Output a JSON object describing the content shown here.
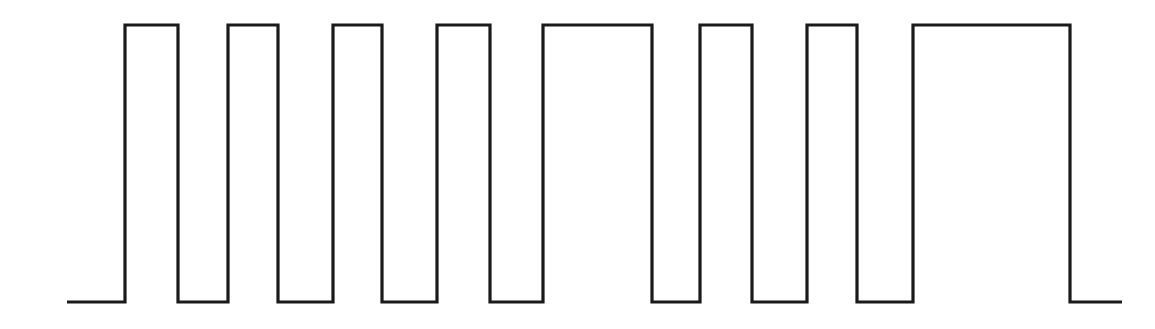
{
  "page": {
    "background_color": "#ffffff",
    "width": 1155,
    "height": 329
  },
  "chart_data": {
    "type": "line",
    "subtitle": "",
    "xlabel": "",
    "ylabel": "",
    "grid": false,
    "legend": "none",
    "annotations": [],
    "tick_labels": {
      "x": [],
      "y": []
    },
    "axis_ranges": {
      "xlim": [
        0,
        1155
      ],
      "ylim": [
        0,
        329
      ]
    },
    "style": {
      "line_color": "#1a1a1a",
      "line_width": 3.2,
      "fill": "none",
      "interpolation": "step"
    },
    "levels": {
      "low_y": 302,
      "high_y": 25,
      "low_value": 0,
      "high_value": 1
    },
    "trace_start_x": 67,
    "trace_end_x": 1122,
    "pulse_count": 8,
    "pulses": [
      {
        "index": 1,
        "rise_x": 125,
        "fall_x": 178,
        "width": 53
      },
      {
        "index": 2,
        "rise_x": 228,
        "fall_x": 278,
        "width": 50
      },
      {
        "index": 3,
        "rise_x": 333,
        "fall_x": 382,
        "width": 49
      },
      {
        "index": 4,
        "rise_x": 437,
        "fall_x": 490,
        "width": 53
      },
      {
        "index": 5,
        "rise_x": 543,
        "fall_x": 652,
        "width": 109
      },
      {
        "index": 6,
        "rise_x": 700,
        "fall_x": 752,
        "width": 52
      },
      {
        "index": 7,
        "rise_x": 807,
        "fall_x": 857,
        "width": 50
      },
      {
        "index": 8,
        "rise_x": 913,
        "fall_x": 1070,
        "width": 157
      }
    ],
    "series": [
      {
        "name": "signal",
        "x": [
          67,
          125,
          125,
          178,
          178,
          228,
          228,
          278,
          278,
          333,
          333,
          382,
          382,
          437,
          437,
          490,
          490,
          543,
          543,
          652,
          652,
          700,
          700,
          752,
          752,
          807,
          807,
          857,
          857,
          913,
          913,
          1070,
          1070,
          1122
        ],
        "values": [
          0,
          0,
          1,
          1,
          0,
          0,
          1,
          1,
          0,
          0,
          1,
          1,
          0,
          0,
          1,
          1,
          0,
          0,
          1,
          1,
          0,
          0,
          1,
          1,
          0,
          0,
          1,
          1,
          0,
          0,
          1,
          1,
          0,
          0
        ]
      }
    ],
    "low_segments": [
      {
        "from_x": 67,
        "to_x": 125
      },
      {
        "from_x": 178,
        "to_x": 228
      },
      {
        "from_x": 278,
        "to_x": 333
      },
      {
        "from_x": 382,
        "to_x": 437
      },
      {
        "from_x": 490,
        "to_x": 543
      },
      {
        "from_x": 652,
        "to_x": 700
      },
      {
        "from_x": 752,
        "to_x": 807
      },
      {
        "from_x": 857,
        "to_x": 913
      },
      {
        "from_x": 1070,
        "to_x": 1122
      }
    ]
  }
}
